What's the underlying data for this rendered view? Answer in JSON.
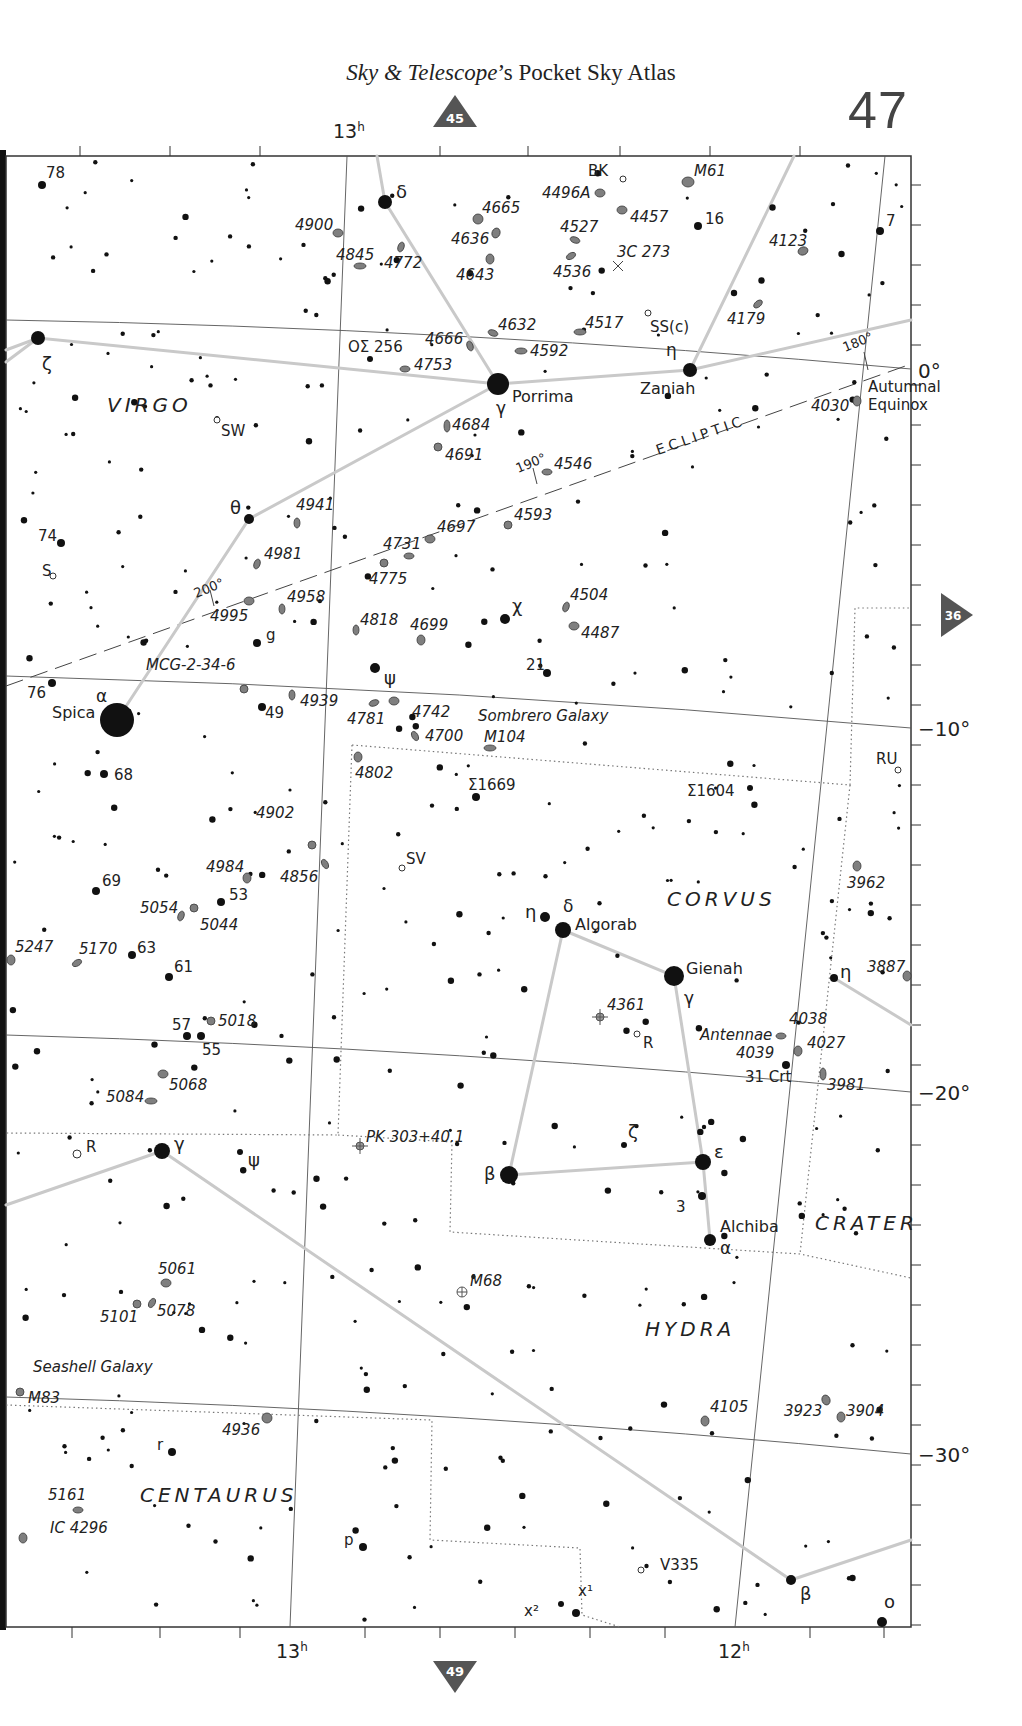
{
  "header": {
    "title_italic": "Sky & Telescope",
    "title_rest": "’s Pocket Sky Atlas",
    "page_number": "47"
  },
  "navigation": {
    "up": {
      "label": "45",
      "direction": "up"
    },
    "down": {
      "label": "49",
      "direction": "down"
    },
    "right": {
      "label": "36",
      "direction": "right"
    }
  },
  "axes": {
    "ra_top": [
      {
        "label": "13",
        "sup": "h"
      }
    ],
    "ra_bottom": [
      {
        "label": "13",
        "sup": "h"
      },
      {
        "label": "12",
        "sup": "h"
      }
    ],
    "declination": [
      "0°",
      "−10°",
      "−20°",
      "−30°"
    ],
    "equinox_label": [
      "Autumnal",
      "Equinox"
    ],
    "ecliptic_label": "ECLIPTIC",
    "ecliptic_ticks": [
      "180°",
      "190°",
      "200°"
    ]
  },
  "colors": {
    "star": "#111111",
    "galaxy_fill": "#7f7f7f",
    "galaxy_stroke": "#3a3a3a",
    "constellation_line": "#c9c9c9",
    "grid_line": "#555555",
    "nav_marker": "#555555",
    "boundary": "#777777"
  },
  "constellations": [
    {
      "name": "VIRGO",
      "x": 107,
      "y": 412
    },
    {
      "name": "CORVUS",
      "x": 667,
      "y": 906
    },
    {
      "name": "CRATER",
      "x": 815,
      "y": 1230
    },
    {
      "name": "HYDRA",
      "x": 645,
      "y": 1336
    },
    {
      "name": "CENTAURUS",
      "x": 140,
      "y": 1502
    }
  ],
  "named_stars": [
    {
      "name": "Porrima",
      "greek": "γ",
      "x": 498,
      "y": 384,
      "r": 11,
      "lx": 512,
      "ly": 402,
      "gx": 496,
      "gy": 414
    },
    {
      "name": "Zaniah",
      "greek": "η",
      "x": 690,
      "y": 370,
      "r": 7,
      "lx": 640,
      "ly": 394,
      "gx": 666,
      "gy": 356
    },
    {
      "name": "Spica",
      "greek": "α",
      "x": 117,
      "y": 720,
      "r": 17,
      "lx": 52,
      "ly": 718,
      "gx": 96,
      "gy": 702
    },
    {
      "name": "Algorab",
      "greek": "δ",
      "x": 563,
      "y": 930,
      "r": 8,
      "lx": 575,
      "ly": 930,
      "gx": 563,
      "gy": 912
    },
    {
      "name": "Gienah",
      "greek": "γ",
      "x": 674,
      "y": 976,
      "r": 10,
      "lx": 686,
      "ly": 974,
      "gx": 684,
      "gy": 1004
    },
    {
      "name": "Alchiba",
      "greek": "α",
      "x": 710,
      "y": 1240,
      "r": 6,
      "lx": 720,
      "ly": 1232,
      "gx": 720,
      "gy": 1254
    }
  ],
  "greek_stars": [
    {
      "greek": "δ",
      "x": 385,
      "y": 202,
      "r": 7,
      "lx": 396,
      "ly": 198
    },
    {
      "greek": "ζ",
      "x": 38,
      "y": 338,
      "r": 7,
      "lx": 42,
      "ly": 370
    },
    {
      "greek": "θ",
      "x": 249,
      "y": 519,
      "r": 5,
      "lx": 230,
      "ly": 514
    },
    {
      "greek": "χ",
      "x": 505,
      "y": 619,
      "r": 5,
      "lx": 512,
      "ly": 612
    },
    {
      "greek": "ψ",
      "x": 375,
      "y": 668,
      "r": 5,
      "lx": 384,
      "ly": 684
    },
    {
      "greek": "η",
      "x": 545,
      "y": 917,
      "r": 5,
      "lx": 525,
      "ly": 918
    },
    {
      "greek": "β",
      "x": 509,
      "y": 1175,
      "r": 9,
      "lx": 484,
      "ly": 1180
    },
    {
      "greek": "ε",
      "x": 703,
      "y": 1162,
      "r": 8,
      "lx": 714,
      "ly": 1158
    },
    {
      "greek": "ζ",
      "x": 624,
      "y": 1145,
      "r": 3,
      "lx": 628,
      "ly": 1138
    },
    {
      "greek": "γ",
      "x": 162,
      "y": 1151,
      "r": 8,
      "lx": 174,
      "ly": 1150
    },
    {
      "greek": "ψ",
      "x": 240,
      "y": 1152,
      "r": 3,
      "lx": 248,
      "ly": 1166
    },
    {
      "greek": "η",
      "x": 834,
      "y": 978,
      "r": 4,
      "lx": 840,
      "ly": 978
    },
    {
      "greek": "β",
      "x": 791,
      "y": 1580,
      "r": 5,
      "lx": 800,
      "ly": 1600
    },
    {
      "greek": "o",
      "x": 882,
      "y": 1622,
      "r": 5,
      "lx": 884,
      "ly": 1608
    }
  ],
  "numbered_stars": [
    {
      "label": "78",
      "x": 42,
      "y": 185,
      "r": 4,
      "lx": 46,
      "ly": 178
    },
    {
      "label": "16",
      "x": 698,
      "y": 226,
      "r": 4,
      "lx": 705,
      "ly": 224
    },
    {
      "label": "7",
      "x": 880,
      "y": 231,
      "r": 4,
      "lx": 886,
      "ly": 226
    },
    {
      "label": "74",
      "x": 61,
      "y": 543,
      "r": 4,
      "lx": 38,
      "ly": 541
    },
    {
      "label": "S",
      "x": 53,
      "y": 576,
      "r": 2,
      "lx": 42,
      "ly": 576,
      "variable": true
    },
    {
      "label": "SW",
      "x": 217,
      "y": 420,
      "r": 2,
      "lx": 221,
      "ly": 436,
      "variable": true
    },
    {
      "label": "g",
      "x": 257,
      "y": 643,
      "r": 4,
      "lx": 266,
      "ly": 640
    },
    {
      "label": "21",
      "x": 547,
      "y": 673,
      "r": 4,
      "lx": 526,
      "ly": 670
    },
    {
      "label": "76",
      "x": 52,
      "y": 683,
      "r": 4,
      "lx": 27,
      "ly": 698
    },
    {
      "label": "49",
      "x": 262,
      "y": 707,
      "r": 4,
      "lx": 265,
      "ly": 718
    },
    {
      "label": "68",
      "x": 104,
      "y": 774,
      "r": 4,
      "lx": 114,
      "ly": 780
    },
    {
      "label": "69",
      "x": 96,
      "y": 891,
      "r": 4,
      "lx": 102,
      "ly": 886
    },
    {
      "label": "53",
      "x": 221,
      "y": 902,
      "r": 4,
      "lx": 229,
      "ly": 900
    },
    {
      "label": "63",
      "x": 132,
      "y": 955,
      "r": 4,
      "lx": 137,
      "ly": 953
    },
    {
      "label": "61",
      "x": 169,
      "y": 977,
      "r": 4,
      "lx": 174,
      "ly": 972
    },
    {
      "label": "57",
      "x": 187,
      "y": 1036,
      "r": 4,
      "lx": 172,
      "ly": 1030
    },
    {
      "label": "55",
      "x": 201,
      "y": 1036,
      "r": 4,
      "lx": 202,
      "ly": 1055
    },
    {
      "label": "3",
      "x": 702,
      "y": 1196,
      "r": 4,
      "lx": 676,
      "ly": 1212
    },
    {
      "label": "r",
      "x": 172,
      "y": 1452,
      "r": 4,
      "lx": 157,
      "ly": 1450
    },
    {
      "label": "p",
      "x": 363,
      "y": 1547,
      "r": 4,
      "lx": 344,
      "ly": 1545
    },
    {
      "label": "31 Crt",
      "x": 786,
      "y": 1065,
      "r": 4,
      "lx": 745,
      "ly": 1082
    },
    {
      "label": "RU",
      "x": 898,
      "y": 770,
      "r": 2,
      "lx": 876,
      "ly": 764,
      "variable": true
    },
    {
      "label": "SV",
      "x": 402,
      "y": 868,
      "r": 2,
      "lx": 406,
      "ly": 864,
      "variable": true
    },
    {
      "label": "R",
      "x": 637,
      "y": 1034,
      "r": 2,
      "lx": 643,
      "ly": 1048,
      "variable": true
    },
    {
      "label": "R",
      "x": 77,
      "y": 1154,
      "r": 3,
      "lx": 86,
      "ly": 1152,
      "variable": true
    },
    {
      "label": "BK",
      "x": 623,
      "y": 179,
      "r": 2,
      "lx": 588,
      "ly": 176,
      "variable": true
    },
    {
      "label": "SS(c)",
      "x": 648,
      "y": 313,
      "r": 2,
      "lx": 650,
      "ly": 332,
      "variable": true
    },
    {
      "label": "V335",
      "x": 641,
      "y": 1570,
      "r": 2,
      "lx": 660,
      "ly": 1570,
      "variable": true
    },
    {
      "label": "x²",
      "x": 561,
      "y": 1604,
      "r": 3,
      "lx": 524,
      "ly": 1616
    },
    {
      "label": "x¹",
      "x": 576,
      "y": 1613,
      "r": 4,
      "lx": 578,
      "ly": 1596
    },
    {
      "label": "ΟΣ 256",
      "x": 370,
      "y": 359,
      "r": 3,
      "lx": 348,
      "ly": 352
    },
    {
      "label": "Σ1669",
      "x": 476,
      "y": 797,
      "r": 4,
      "lx": 468,
      "ly": 790
    },
    {
      "label": "Σ1604",
      "x": 750,
      "y": 788,
      "r": 3,
      "lx": 687,
      "ly": 796
    }
  ],
  "galaxies": [
    {
      "label": "M61",
      "x": 688,
      "y": 182,
      "rx": 6,
      "ry": 5,
      "rot": 0,
      "lx": 694,
      "ly": 176
    },
    {
      "label": "4496A",
      "x": 600,
      "y": 193,
      "rx": 5,
      "ry": 4,
      "rot": 0,
      "lx": 542,
      "ly": 198
    },
    {
      "label": "4457",
      "x": 622,
      "y": 210,
      "rx": 5,
      "ry": 4,
      "rot": 0,
      "lx": 630,
      "ly": 222
    },
    {
      "label": "4665",
      "x": 478,
      "y": 219,
      "rx": 5,
      "ry": 5,
      "rot": 0,
      "lx": 482,
      "ly": 213
    },
    {
      "label": "4900",
      "x": 338,
      "y": 233,
      "rx": 5,
      "ry": 4,
      "rot": 0,
      "lx": 295,
      "ly": 230
    },
    {
      "label": "4636",
      "x": 496,
      "y": 233,
      "rx": 4,
      "ry": 5,
      "rot": 20,
      "lx": 451,
      "ly": 244
    },
    {
      "label": "4527",
      "x": 575,
      "y": 240,
      "rx": 5,
      "ry": 3,
      "rot": 20,
      "lx": 560,
      "ly": 232
    },
    {
      "label": "4772",
      "x": 401,
      "y": 247,
      "rx": 3,
      "ry": 5,
      "rot": 20,
      "lx": 384,
      "ly": 268
    },
    {
      "label": "4845",
      "x": 360,
      "y": 266,
      "rx": 6,
      "ry": 3,
      "rot": 0,
      "lx": 336,
      "ly": 260
    },
    {
      "label": "4643",
      "x": 490,
      "y": 259,
      "rx": 4,
      "ry": 5,
      "rot": 0,
      "lx": 456,
      "ly": 280
    },
    {
      "label": "4536",
      "x": 571,
      "y": 256,
      "rx": 5,
      "ry": 3,
      "rot": -30,
      "lx": 553,
      "ly": 277
    },
    {
      "label": "4123",
      "x": 803,
      "y": 251,
      "rx": 5,
      "ry": 4,
      "rot": -20,
      "lx": 769,
      "ly": 246
    },
    {
      "label": "4179",
      "x": 758,
      "y": 304,
      "rx": 5,
      "ry": 3,
      "rot": -40,
      "lx": 727,
      "ly": 324
    },
    {
      "label": "4632",
      "x": 493,
      "y": 333,
      "rx": 5,
      "ry": 3,
      "rot": 20,
      "lx": 498,
      "ly": 330
    },
    {
      "label": "4517",
      "x": 580,
      "y": 332,
      "rx": 6,
      "ry": 3,
      "rot": 0,
      "lx": 585,
      "ly": 328
    },
    {
      "label": "4666",
      "x": 470,
      "y": 346,
      "rx": 3,
      "ry": 5,
      "rot": -20,
      "lx": 425,
      "ly": 344
    },
    {
      "label": "4592",
      "x": 521,
      "y": 351,
      "rx": 6,
      "ry": 3,
      "rot": 0,
      "lx": 530,
      "ly": 356
    },
    {
      "label": "4753",
      "x": 405,
      "y": 369,
      "rx": 5,
      "ry": 3,
      "rot": 0,
      "lx": 414,
      "ly": 370
    },
    {
      "label": "4030",
      "x": 857,
      "y": 401,
      "rx": 4,
      "ry": 5,
      "rot": 0,
      "lx": 811,
      "ly": 411
    },
    {
      "label": "4684",
      "x": 447,
      "y": 426,
      "rx": 3,
      "ry": 6,
      "rot": 0,
      "lx": 452,
      "ly": 430
    },
    {
      "label": "4691",
      "x": 438,
      "y": 447,
      "rx": 4,
      "ry": 4,
      "rot": 0,
      "lx": 445,
      "ly": 460
    },
    {
      "label": "4546",
      "x": 547,
      "y": 472,
      "rx": 5,
      "ry": 3,
      "rot": 0,
      "lx": 554,
      "ly": 469
    },
    {
      "label": "4941",
      "x": 297,
      "y": 523,
      "rx": 3,
      "ry": 5,
      "rot": 0,
      "lx": 296,
      "ly": 510
    },
    {
      "label": "4593",
      "x": 508,
      "y": 525,
      "rx": 4,
      "ry": 4,
      "rot": 0,
      "lx": 514,
      "ly": 520
    },
    {
      "label": "4697",
      "x": 430,
      "y": 539,
      "rx": 5,
      "ry": 4,
      "rot": 0,
      "lx": 437,
      "ly": 532
    },
    {
      "label": "4731",
      "x": 409,
      "y": 556,
      "rx": 5,
      "ry": 3,
      "rot": 0,
      "lx": 383,
      "ly": 549
    },
    {
      "label": "4775",
      "x": 384,
      "y": 563,
      "rx": 4,
      "ry": 4,
      "rot": 0,
      "lx": 369,
      "ly": 584
    },
    {
      "label": "4981",
      "x": 257,
      "y": 564,
      "rx": 3,
      "ry": 5,
      "rot": 20,
      "lx": 264,
      "ly": 559
    },
    {
      "label": "4995",
      "x": 249,
      "y": 601,
      "rx": 5,
      "ry": 4,
      "rot": 0,
      "lx": 210,
      "ly": 621
    },
    {
      "label": "4958",
      "x": 282,
      "y": 609,
      "rx": 3,
      "ry": 5,
      "rot": 0,
      "lx": 287,
      "ly": 602
    },
    {
      "label": "4504",
      "x": 566,
      "y": 607,
      "rx": 3,
      "ry": 5,
      "rot": 20,
      "lx": 570,
      "ly": 600
    },
    {
      "label": "4818",
      "x": 356,
      "y": 630,
      "rx": 3,
      "ry": 5,
      "rot": 0,
      "lx": 360,
      "ly": 625
    },
    {
      "label": "4699",
      "x": 421,
      "y": 640,
      "rx": 4,
      "ry": 5,
      "rot": 0,
      "lx": 410,
      "ly": 630
    },
    {
      "label": "4487",
      "x": 574,
      "y": 626,
      "rx": 5,
      "ry": 4,
      "rot": 0,
      "lx": 581,
      "ly": 638
    },
    {
      "label": "MCG-2-34-6",
      "x": 244,
      "y": 689,
      "rx": 4,
      "ry": 4,
      "rot": 0,
      "lx": 146,
      "ly": 670
    },
    {
      "label": "4939",
      "x": 292,
      "y": 695,
      "rx": 3,
      "ry": 5,
      "rot": 0,
      "lx": 300,
      "ly": 706
    },
    {
      "label": "4781",
      "x": 374,
      "y": 703,
      "rx": 5,
      "ry": 3,
      "rot": -20,
      "lx": 347,
      "ly": 724
    },
    {
      "label": "4742",
      "x": 394,
      "y": 701,
      "rx": 5,
      "ry": 4,
      "rot": 0,
      "lx": 412,
      "ly": 717
    },
    {
      "label": "4700",
      "x": 415,
      "y": 736,
      "rx": 3,
      "ry": 5,
      "rot": -30,
      "lx": 425,
      "ly": 741
    },
    {
      "label": "Sombrero Galaxy",
      "x": 490,
      "y": 748,
      "rx": 6,
      "ry": 3,
      "rot": 0,
      "lx": 478,
      "ly": 721
    },
    {
      "label": "M104",
      "x": 490,
      "y": 748,
      "rx": 0,
      "ry": 0,
      "rot": 0,
      "lx": 484,
      "ly": 742
    },
    {
      "label": "4802",
      "x": 358,
      "y": 757,
      "rx": 4,
      "ry": 5,
      "rot": 0,
      "lx": 355,
      "ly": 778
    },
    {
      "label": "4902",
      "x": 312,
      "y": 845,
      "rx": 4,
      "ry": 4,
      "rot": 0,
      "lx": 256,
      "ly": 818
    },
    {
      "label": "4856",
      "x": 325,
      "y": 864,
      "rx": 3,
      "ry": 5,
      "rot": -30,
      "lx": 280,
      "ly": 882
    },
    {
      "label": "4984",
      "x": 247,
      "y": 878,
      "rx": 4,
      "ry": 5,
      "rot": 0,
      "lx": 206,
      "ly": 872
    },
    {
      "label": "5054",
      "x": 181,
      "y": 916,
      "rx": 3,
      "ry": 5,
      "rot": 20,
      "lx": 140,
      "ly": 913
    },
    {
      "label": "5044",
      "x": 194,
      "y": 908,
      "rx": 4,
      "ry": 4,
      "rot": 0,
      "lx": 200,
      "ly": 930
    },
    {
      "label": "3962",
      "x": 857,
      "y": 866,
      "rx": 4,
      "ry": 5,
      "rot": 0,
      "lx": 847,
      "ly": 888
    },
    {
      "label": "5247",
      "x": 11,
      "y": 960,
      "rx": 4,
      "ry": 5,
      "rot": 0,
      "lx": 15,
      "ly": 952
    },
    {
      "label": "5170",
      "x": 77,
      "y": 963,
      "rx": 5,
      "ry": 3,
      "rot": -30,
      "lx": 79,
      "ly": 954
    },
    {
      "label": "3887",
      "x": 907,
      "y": 976,
      "rx": 4,
      "ry": 5,
      "rot": 0,
      "lx": 867,
      "ly": 972
    },
    {
      "label": "5018",
      "x": 211,
      "y": 1021,
      "rx": 4,
      "ry": 4,
      "rot": 0,
      "lx": 218,
      "ly": 1026
    },
    {
      "label": "4361",
      "x": 600,
      "y": 1017,
      "rx": 5,
      "ry": 5,
      "rot": 0,
      "lx": 607,
      "ly": 1010,
      "type": "planetary"
    },
    {
      "label": "4038",
      "x": 781,
      "y": 1036,
      "rx": 5,
      "ry": 3,
      "rot": 0,
      "lx": 789,
      "ly": 1024
    },
    {
      "label": "Antennae",
      "x": 781,
      "y": 1036,
      "rx": 0,
      "ry": 0,
      "rot": 0,
      "lx": 700,
      "ly": 1040
    },
    {
      "label": "4039",
      "x": 782,
      "y": 1040,
      "rx": 0,
      "ry": 0,
      "rot": 0,
      "lx": 736,
      "ly": 1058
    },
    {
      "label": "4027",
      "x": 798,
      "y": 1051,
      "rx": 4,
      "ry": 5,
      "rot": 0,
      "lx": 807,
      "ly": 1048
    },
    {
      "label": "3981",
      "x": 823,
      "y": 1074,
      "rx": 3,
      "ry": 6,
      "rot": 0,
      "lx": 827,
      "ly": 1090
    },
    {
      "label": "5068",
      "x": 163,
      "y": 1074,
      "rx": 5,
      "ry": 4,
      "rot": 0,
      "lx": 169,
      "ly": 1090
    },
    {
      "label": "5084",
      "x": 151,
      "y": 1101,
      "rx": 6,
      "ry": 3,
      "rot": 0,
      "lx": 106,
      "ly": 1102
    },
    {
      "label": "PK 303+40.1",
      "x": 360,
      "y": 1146,
      "rx": 5,
      "ry": 5,
      "rot": 0,
      "lx": 366,
      "ly": 1142,
      "type": "planetary"
    },
    {
      "label": "M68",
      "x": 462,
      "y": 1292,
      "rx": 5,
      "ry": 5,
      "rot": 0,
      "lx": 470,
      "ly": 1286,
      "type": "globular"
    },
    {
      "label": "5061",
      "x": 166,
      "y": 1283,
      "rx": 5,
      "ry": 4,
      "rot": 0,
      "lx": 158,
      "ly": 1274
    },
    {
      "label": "5101",
      "x": 137,
      "y": 1304,
      "rx": 4,
      "ry": 4,
      "rot": 0,
      "lx": 100,
      "ly": 1322
    },
    {
      "label": "5078",
      "x": 152,
      "y": 1303,
      "rx": 3,
      "ry": 5,
      "rot": 30,
      "lx": 157,
      "ly": 1316
    },
    {
      "label": "Seashell Galaxy",
      "x": 20,
      "y": 1392,
      "rx": 0,
      "ry": 0,
      "rot": 0,
      "lx": 33,
      "ly": 1372
    },
    {
      "label": "M83",
      "x": 20,
      "y": 1392,
      "rx": 4,
      "ry": 4,
      "rot": 0,
      "lx": 28,
      "ly": 1403
    },
    {
      "label": "4105",
      "x": 705,
      "y": 1421,
      "rx": 4,
      "ry": 5,
      "rot": 0,
      "lx": 710,
      "ly": 1412
    },
    {
      "label": "3923",
      "x": 826,
      "y": 1400,
      "rx": 4,
      "ry": 5,
      "rot": -20,
      "lx": 784,
      "ly": 1416
    },
    {
      "label": "3904",
      "x": 841,
      "y": 1417,
      "rx": 4,
      "ry": 5,
      "rot": 0,
      "lx": 846,
      "ly": 1416
    },
    {
      "label": "4936",
      "x": 267,
      "y": 1418,
      "rx": 5,
      "ry": 5,
      "rot": 0,
      "lx": 222,
      "ly": 1435
    },
    {
      "label": "5161",
      "x": 78,
      "y": 1510,
      "rx": 5,
      "ry": 3,
      "rot": 0,
      "lx": 48,
      "ly": 1500
    },
    {
      "label": "IC 4296",
      "x": 23,
      "y": 1538,
      "rx": 4,
      "ry": 5,
      "rot": 0,
      "lx": 50,
      "ly": 1533
    }
  ]
}
